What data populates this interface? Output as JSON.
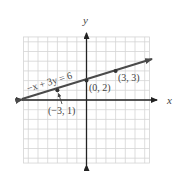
{
  "chart_data": {
    "type": "line",
    "title": "",
    "xlabel": "x",
    "ylabel": "y",
    "xlim": [
      -6.5,
      6.5
    ],
    "ylim": [
      -6.5,
      6.5
    ],
    "grid": true,
    "series": [
      {
        "name": "-x + 3y = 6",
        "equation": "−x + 3y = 6",
        "slope": 0.3333,
        "intercept": 2,
        "points": [
          {
            "x": -3,
            "y": 1,
            "label": "(−3, 1)"
          },
          {
            "x": 0,
            "y": 2,
            "label": "(0, 2)"
          },
          {
            "x": 3,
            "y": 3,
            "label": "(3, 3)"
          }
        ],
        "color": "#4a4a4a"
      }
    ],
    "annotations": [
      {
        "text": "−x + 3y = 6",
        "position": "above line, left of y-axis",
        "rotated": true
      },
      {
        "text": "(−3, 1)",
        "position": "below point with pointer arrow"
      },
      {
        "text": "(0, 2)",
        "position": "below-right of point"
      },
      {
        "text": "(3, 3)",
        "position": "below point"
      }
    ]
  },
  "labels": {
    "x_axis": "x",
    "y_axis": "y",
    "equation": "−x + 3y = 6",
    "p1": "(−3, 1)",
    "p2": "(0, 2)",
    "p3": "(3, 3)"
  },
  "colors": {
    "grid": "#d4d4d4",
    "axis": "#222222",
    "line": "#4a4a4a",
    "text": "#444444"
  }
}
